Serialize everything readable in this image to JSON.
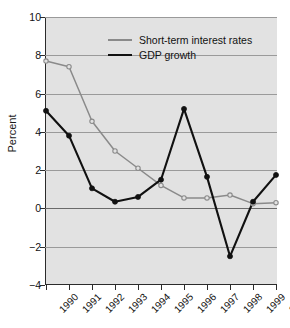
{
  "chart_data": {
    "type": "line",
    "title": "",
    "xlabel": "",
    "ylabel": "Percent",
    "x": [
      1990,
      1991,
      1992,
      1993,
      1994,
      1995,
      1996,
      1997,
      1998,
      1999,
      2000
    ],
    "categories": [
      "1990",
      "1991",
      "1992",
      "1993",
      "1994",
      "1995",
      "1996",
      "1997",
      "1998",
      "1999",
      "2000"
    ],
    "xlim": [
      1990,
      2000
    ],
    "ylim": [
      -4,
      10
    ],
    "yticks": [
      -4,
      -2,
      0,
      2,
      4,
      6,
      8,
      10
    ],
    "ytick_labels": [
      "−4",
      "−2",
      "0",
      "2",
      "4",
      "6",
      "8",
      "10"
    ],
    "grid": true,
    "legend_position": "upper center",
    "series": [
      {
        "name": "Short-term interest rates",
        "color": "#8a8a8a",
        "marker": "open-circle",
        "values": [
          7.7,
          7.4,
          4.55,
          3.0,
          2.1,
          1.2,
          0.55,
          0.55,
          0.7,
          0.25,
          0.3
        ]
      },
      {
        "name": "GDP growth",
        "color": "#111111",
        "marker": "filled-circle",
        "values": [
          5.1,
          3.8,
          1.05,
          0.35,
          0.6,
          1.5,
          5.2,
          1.65,
          -2.5,
          0.35,
          1.75
        ]
      }
    ]
  },
  "legend": {
    "entries": [
      {
        "label": "Short-term interest rates"
      },
      {
        "label": "GDP growth"
      }
    ]
  },
  "colors": {
    "plot_background": "#e2e2e2",
    "page_background": "#ffffff",
    "gridline": "#9a9a9a",
    "zero_line": "#6a6a6a",
    "axis": "#2b2b2b",
    "rates_line": "#8a8a8a",
    "gdp_line": "#111111"
  }
}
